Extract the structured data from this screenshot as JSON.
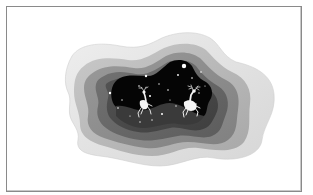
{
  "image": {
    "description": "Grayscale paper-cut layered illustration: concentric wavy cloud-shaped layers framing a dark starry night with two leaping deer",
    "frame_color": "#8a8a8a",
    "background": "#ffffff",
    "layers": [
      {
        "name": "outer-layer",
        "color": "#e2e2e2"
      },
      {
        "name": "layer-2",
        "color": "#b9b9b9"
      },
      {
        "name": "layer-3",
        "color": "#8f8f8f"
      },
      {
        "name": "layer-4",
        "color": "#6a6a6a"
      },
      {
        "name": "layer-5",
        "color": "#4a4a4a"
      },
      {
        "name": "night-sky",
        "color": "#050505"
      }
    ],
    "subjects": [
      "deer-left",
      "deer-right",
      "stars"
    ]
  }
}
